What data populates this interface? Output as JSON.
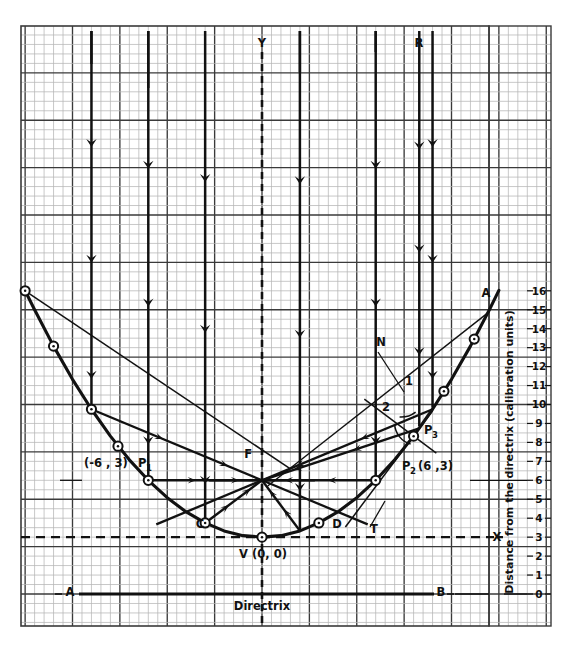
{
  "figure": {
    "type": "geometry-diagram"
  },
  "axes": {
    "y_axis_label": "Distance from the directrix (calibration units)",
    "y_ticks": [
      "16",
      "15",
      "14",
      "13",
      "12",
      "11",
      "10",
      "9",
      "8",
      "7",
      "6",
      "5",
      "4",
      "3",
      "2",
      "1",
      "0"
    ],
    "y_min": 0,
    "y_max": 16,
    "x_axis_letter": "X",
    "y_axis_letter": "Y"
  },
  "labels": {
    "directrix": "Directrix",
    "directrix_left_end": "A",
    "directrix_right_end": "B",
    "axis_ray_top": "R",
    "normal": "N",
    "tangent": "T",
    "focus": "F",
    "vertex": "V (0, 0)",
    "point_c": "C",
    "point_d": "D",
    "point_p1": "P",
    "point_p1_sub": "1",
    "point_p1_coords": "(-6 , 3)",
    "point_p2": "P",
    "point_p2_sub": "2",
    "point_p2_coords": "(6 ,3)",
    "point_p3": "P",
    "point_p3_sub": "3",
    "upper_right_ray": "A",
    "angle_1": "1",
    "angle_2": "2"
  },
  "colors": {
    "ink": "#111111",
    "grid_minor": "#b5b5b5",
    "grid_major": "#3a3a3a",
    "background": "#ffffff"
  },
  "chart_data": {
    "type": "line",
    "title": "",
    "xlabel": "",
    "ylabel": "Distance from the directrix (calibration units)",
    "ylim": [
      0,
      16
    ],
    "xlim": [
      -13,
      13
    ],
    "curve_equation": "y = x^2/12 + 3",
    "focus": {
      "x": 0,
      "y": 6
    },
    "vertex": {
      "x": 0,
      "y": 3,
      "label": "V (0, 0)"
    },
    "directrix_y": 0,
    "marked_points": [
      {
        "name": "P1",
        "x": -6,
        "y": 6
      },
      {
        "name": "C",
        "x": -3,
        "y": 3.75
      },
      {
        "name": "V",
        "x": 0,
        "y": 3
      },
      {
        "name": "D",
        "x": 3,
        "y": 3.75
      },
      {
        "name": "P2",
        "x": 6,
        "y": 6
      },
      {
        "name": "P3",
        "x": 8,
        "y": 8.33
      }
    ],
    "incident_ray_x_positions": [
      -9,
      -6,
      -3,
      2,
      6,
      9
    ],
    "series": [
      {
        "name": "parabola",
        "values": [
          {
            "x": -12.5,
            "y": 16.0
          },
          {
            "x": -12,
            "y": 15.0
          },
          {
            "x": -11,
            "y": 13.08
          },
          {
            "x": -10,
            "y": 11.33
          },
          {
            "x": -9,
            "y": 9.75
          },
          {
            "x": -8,
            "y": 8.33
          },
          {
            "x": -7,
            "y": 7.08
          },
          {
            "x": -6,
            "y": 6.0
          },
          {
            "x": -5,
            "y": 5.08
          },
          {
            "x": -4,
            "y": 4.33
          },
          {
            "x": -3,
            "y": 3.75
          },
          {
            "x": -2,
            "y": 3.33
          },
          {
            "x": -1,
            "y": 3.08
          },
          {
            "x": 0,
            "y": 3.0
          },
          {
            "x": 1,
            "y": 3.08
          },
          {
            "x": 2,
            "y": 3.33
          },
          {
            "x": 3,
            "y": 3.75
          },
          {
            "x": 4,
            "y": 4.33
          },
          {
            "x": 5,
            "y": 5.08
          },
          {
            "x": 6,
            "y": 6.0
          },
          {
            "x": 7,
            "y": 7.08
          },
          {
            "x": 8,
            "y": 8.33
          },
          {
            "x": 9,
            "y": 9.75
          },
          {
            "x": 10,
            "y": 11.33
          },
          {
            "x": 11,
            "y": 13.08
          },
          {
            "x": 12,
            "y": 15.0
          },
          {
            "x": 12.5,
            "y": 16.02
          }
        ]
      }
    ]
  }
}
